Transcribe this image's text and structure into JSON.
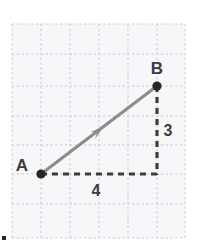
{
  "figure": {
    "background_color": "#ffffff",
    "width": 197,
    "height": 252
  },
  "grid": {
    "line_color": "#c9c9d6",
    "fill_color": "#f7f7f9",
    "style": "dashed",
    "columns": 6,
    "rows": 7,
    "x_lines": [
      12,
      41,
      70,
      99,
      128,
      157,
      185
    ],
    "y_lines": [
      24,
      54,
      86,
      116,
      145,
      174,
      204,
      238
    ]
  },
  "chart_data": {
    "type": "scatter",
    "title": "",
    "xlabel": "",
    "ylabel": "",
    "points": [
      {
        "name": "A",
        "label": "A",
        "x": 41,
        "y": 174,
        "grid_x": 1,
        "grid_y": 5
      },
      {
        "name": "B",
        "label": "B",
        "x": 157,
        "y": 86,
        "grid_x": 5,
        "grid_y": 2
      }
    ],
    "vector": {
      "name": "AB",
      "from": "A",
      "to": "B",
      "color": "#8c8c8c",
      "arrow_midpoint": true,
      "magnitude": 5
    },
    "components": [
      {
        "name": "horizontal",
        "label": "4",
        "value": 4,
        "color": "#3d3d3d",
        "style": "dashed"
      },
      {
        "name": "vertical",
        "label": "3",
        "value": 3,
        "color": "#3d3d3d",
        "style": "dashed"
      }
    ]
  },
  "labels": {
    "point_a": "A",
    "point_b": "B",
    "horizontal_length": "4",
    "vertical_length": "3"
  },
  "colors": {
    "vector": "#8c8c8c",
    "dashed_component": "#3d3d3d",
    "point_marker": "#262626",
    "text": "#3d3d3d",
    "grid_line": "#c9c9d6",
    "grid_fill": "#f7f7f9"
  }
}
